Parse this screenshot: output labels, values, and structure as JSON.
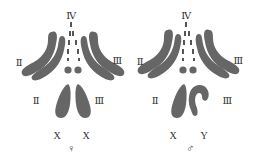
{
  "diagram": {
    "colors": {
      "chromosome": "#666666",
      "label": "#333333",
      "background": "#ffffff"
    },
    "panels": [
      {
        "id": "female",
        "labels": {
          "top": "Ⅳ",
          "upper_left": "Ⅱ",
          "upper_right": "Ⅲ",
          "lower_left": "Ⅱ",
          "lower_right": "Ⅲ",
          "sex_chrom_left": "X",
          "sex_chrom_right": "X",
          "sex_symbol": "♀"
        }
      },
      {
        "id": "male",
        "labels": {
          "top": "Ⅳ",
          "upper_left": "Ⅱ",
          "upper_right": "Ⅲ",
          "lower_left": "Ⅱ",
          "lower_right": "Ⅲ",
          "sex_chrom_left": "X",
          "sex_chrom_right": "Y",
          "sex_symbol": "♂"
        }
      }
    ]
  }
}
